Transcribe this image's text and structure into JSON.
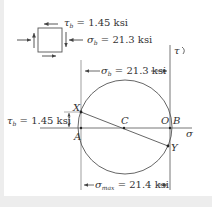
{
  "figure": {
    "element": {
      "shear_label": "τb = 1.45 ksi",
      "shear_symbol": "τ",
      "shear_sub": "b",
      "shear_value": " = 1.45 ksi",
      "normal_symbol": "σ",
      "normal_sub": "b",
      "normal_value": " = 21.3 ksi"
    },
    "circle": {
      "tau_axis_label": "τ",
      "sigma_axis_label": "σ",
      "points": {
        "X": "X",
        "A": "A",
        "C": "C",
        "O": "O",
        "B": "B",
        "Y": "Y"
      },
      "top_dim": {
        "symbol": "σ",
        "sub": "b",
        "value": " = 21.3 ksi"
      },
      "left_dim": {
        "symbol": "τ",
        "sub": "b",
        "value": " = 1.45 ksi"
      },
      "bottom_dim": {
        "symbol": "σ",
        "sub": "max",
        "value": " = 21.4 ksi"
      }
    },
    "colors": {
      "line": "#555555",
      "text": "#333333",
      "background": "#ffffff",
      "frame": "#ededed"
    }
  }
}
